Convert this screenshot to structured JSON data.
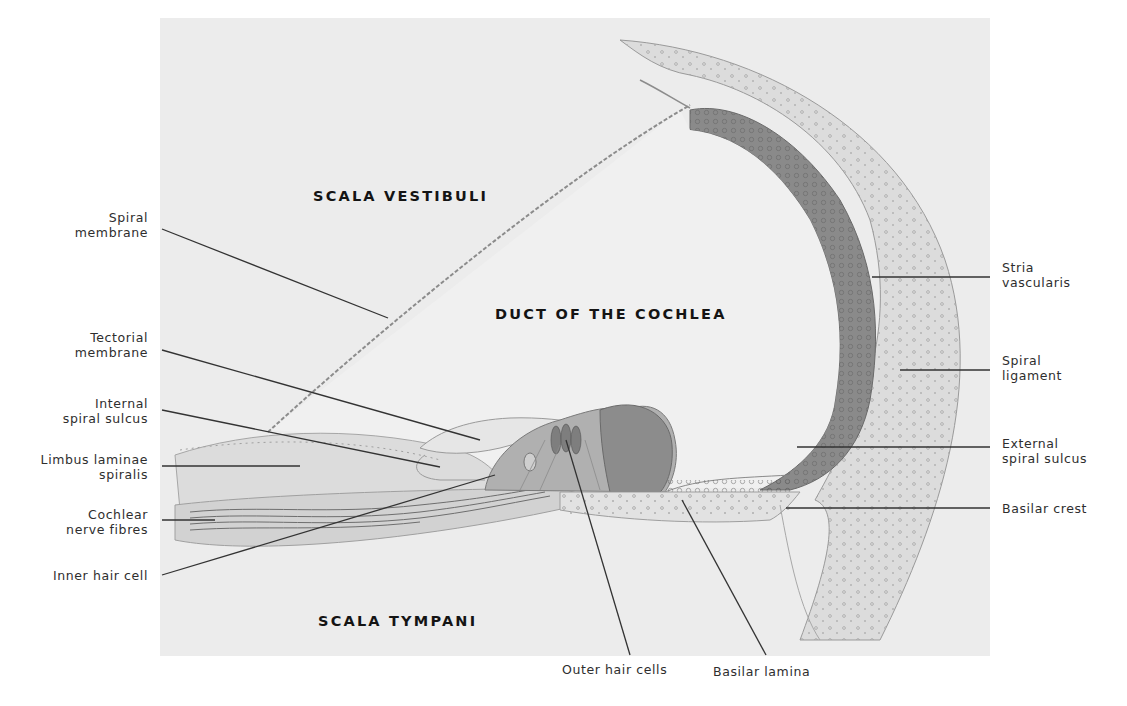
{
  "diagram": {
    "colors": {
      "page_background": "#ffffff",
      "plate_background": "#ececec",
      "stria_vascularis": "#8a8a8a",
      "spiral_organ": "#9a9a9a",
      "tissue": "#dadada",
      "leader_line": "#333333",
      "label_text": "#2e2e2e",
      "region_text": "#141414"
    },
    "regions": [
      {
        "id": "scala-vestibuli",
        "text": "SCALA  VESTIBULI"
      },
      {
        "id": "duct-of-cochlea",
        "text": "DUCT  OF  THE  COCHLEA"
      },
      {
        "id": "scala-tympani",
        "text": "SCALA  TYMPANI"
      }
    ],
    "labels_left": [
      {
        "id": "spiral-membrane",
        "line1": "Spiral",
        "line2": "membrane"
      },
      {
        "id": "tectorial-membrane",
        "line1": "Tectorial",
        "line2": "membrane"
      },
      {
        "id": "internal-spiral-sulcus",
        "line1": "Internal",
        "line2": "spiral sulcus"
      },
      {
        "id": "limbus-laminae-spiralis",
        "line1": "Limbus laminae",
        "line2": "spiralis"
      },
      {
        "id": "cochlear-nerve-fibres",
        "line1": "Cochlear",
        "line2": "nerve fibres"
      },
      {
        "id": "inner-hair-cell",
        "line1": "Inner hair cell",
        "line2": ""
      }
    ],
    "labels_right": [
      {
        "id": "stria-vascularis",
        "line1": "Stria",
        "line2": "vascularis"
      },
      {
        "id": "spiral-ligament",
        "line1": "Spiral",
        "line2": "ligament"
      },
      {
        "id": "external-spiral-sulcus",
        "line1": "External",
        "line2": "spiral sulcus"
      },
      {
        "id": "basilar-crest",
        "line1": "Basilar crest",
        "line2": ""
      }
    ],
    "labels_bottom": [
      {
        "id": "outer-hair-cells",
        "line1": "Outer hair cells"
      },
      {
        "id": "basilar-lamina",
        "line1": "Basilar lamina"
      }
    ]
  }
}
